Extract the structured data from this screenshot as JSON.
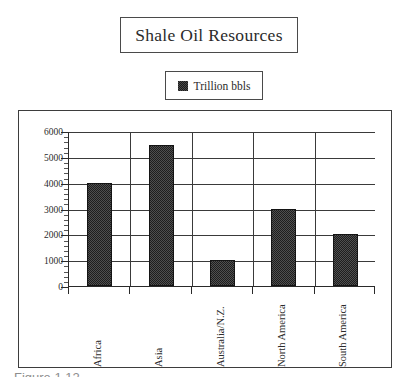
{
  "title": {
    "text": "Shale Oil Resources"
  },
  "legend": {
    "label": "Trillion bbls",
    "swatch_icon": "legend-swatch-icon",
    "swatch_color": "#1e1e1e",
    "position": "top-center"
  },
  "caption": {
    "text": "Figure 1.12"
  },
  "chart_data": {
    "type": "bar",
    "title": "Shale Oil Resources",
    "xlabel": "",
    "ylabel": "",
    "categories": [
      "Africa",
      "Asia",
      "Australia/N.Z.",
      "North America",
      "South America"
    ],
    "series": [
      {
        "name": "Trillion bbls",
        "values": [
          4000,
          5450,
          1000,
          3000,
          2000
        ],
        "color": "#1e1e1e"
      }
    ],
    "ylim": [
      0,
      6000
    ],
    "ytick_values": [
      0,
      1000,
      2000,
      3000,
      4000,
      5000,
      6000
    ],
    "ytick_labels": [
      "0",
      "1000",
      "2000",
      "3000",
      "4000",
      "5000",
      "6000"
    ],
    "y_minor_tick_interval": 200,
    "grid": true,
    "grid_axis": "both",
    "legend_position": "above-plot",
    "bar_fill": "dithered-black",
    "xtick_label_rotation": 90
  }
}
